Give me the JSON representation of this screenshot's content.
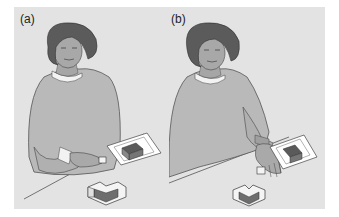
{
  "figure": {
    "panels": [
      {
        "label": "(a)",
        "description": "Woman seated at table reaching toward a small block with right hand; target card with dark block shape on table; assembled L-shaped block structure in foreground"
      },
      {
        "label": "(b)",
        "description": "Woman seated at table placing a block with right hand; target card with dark block shape on table; heart/chevron-shaped block structure in foreground"
      }
    ],
    "colors": {
      "background": "#e3e3e3",
      "sweater": "#b8b8b8",
      "hair": "#5a5a5a",
      "skin": "#a8a8a8",
      "block_dark": "#6e6e6e",
      "block_light": "#f4f4f4",
      "card": "#ffffff"
    }
  }
}
